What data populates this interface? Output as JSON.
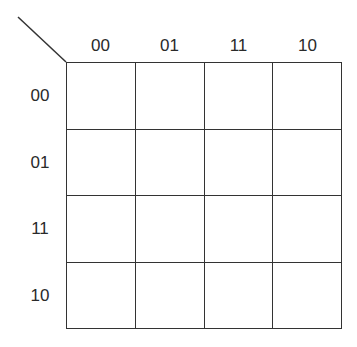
{
  "kmap": {
    "type": "karnaugh-map-4-variable",
    "column_labels": [
      "00",
      "01",
      "11",
      "10"
    ],
    "row_labels": [
      "00",
      "01",
      "11",
      "10"
    ],
    "cells": [
      [
        "",
        "",
        "",
        ""
      ],
      [
        "",
        "",
        "",
        ""
      ],
      [
        "",
        "",
        "",
        ""
      ],
      [
        "",
        "",
        "",
        ""
      ]
    ],
    "line_color": "#333333"
  }
}
